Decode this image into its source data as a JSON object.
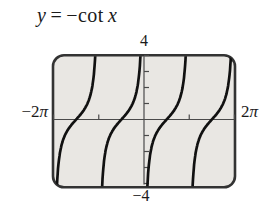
{
  "title": {
    "lhs": "y",
    "eq": "=",
    "func": "−cot",
    "var": "x"
  },
  "window_labels": {
    "ymax": "4",
    "ymin": "−4",
    "xmin_num": "−2",
    "xmin_pi": "π",
    "xmax_num": "2",
    "xmax_pi": "π"
  },
  "colors": {
    "background": "#ffffff",
    "screen_fill": "#e9e7e3",
    "screen_border": "#333333",
    "axis": "#4a4a4a",
    "curve": "#111111",
    "text": "#1a1a1a"
  },
  "chart_data": {
    "type": "line",
    "function": "y = -cot(x)",
    "xlim": [
      -6.28319,
      6.28319
    ],
    "ylim": [
      -4,
      4
    ],
    "xscl": 3.14159,
    "yscl": 1,
    "xscl_label": "π",
    "x_axis_end_labels": {
      "left": "−2π",
      "right": "2π"
    },
    "y_axis_end_labels": {
      "top": "4",
      "bottom": "−4"
    },
    "asymptotes_x": [
      -6.28319,
      -3.14159,
      0,
      3.14159,
      6.28319
    ],
    "x_intercepts": [
      -4.71239,
      -1.5708,
      1.5708,
      4.71239
    ],
    "branch_domains": [
      [
        -6.28319,
        -3.14159
      ],
      [
        -3.14159,
        0
      ],
      [
        0,
        3.14159
      ],
      [
        3.14159,
        6.28319
      ]
    ],
    "branches_increasing": true,
    "grid": false,
    "legend": false
  }
}
